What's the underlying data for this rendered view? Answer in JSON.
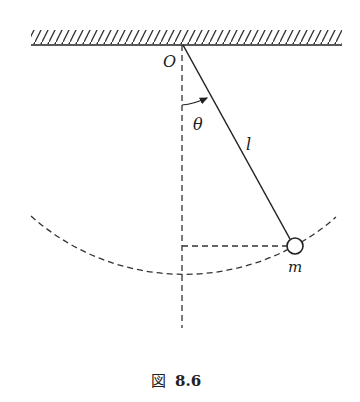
{
  "figure": {
    "caption_prefix": "図",
    "caption_number": "8.6",
    "caption": "図 8.6"
  },
  "labels": {
    "pivot": "O",
    "angle": "θ",
    "length": "l",
    "mass": "m"
  },
  "colors": {
    "ink": "#222222",
    "background": "#ffffff"
  }
}
